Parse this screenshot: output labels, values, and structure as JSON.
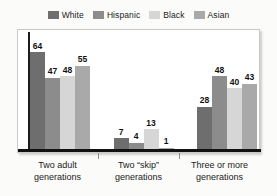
{
  "chart_data": {
    "type": "bar",
    "title": "",
    "subtitle": "",
    "xlabel": "",
    "ylabel": "",
    "ylim": [
      0,
      70
    ],
    "grid": false,
    "legend_position": "top-center",
    "categories": [
      "Two adult generations",
      "Two \"skip\" generations",
      "Three or more generations"
    ],
    "category_lines": [
      [
        "Two adult",
        "generations"
      ],
      [
        "Two “skip”",
        "generations"
      ],
      [
        "Three or more",
        "generations"
      ]
    ],
    "series": [
      {
        "name": "White",
        "color": "#6e6e6e",
        "values": [
          64,
          7,
          28
        ]
      },
      {
        "name": "Hispanic",
        "color": "#8c8c8c",
        "values": [
          47,
          4,
          48
        ]
      },
      {
        "name": "Black",
        "color": "#d6d6d6",
        "values": [
          48,
          13,
          40
        ]
      },
      {
        "name": "Asian",
        "color": "#a9a9a9",
        "values": [
          55,
          1,
          43
        ]
      }
    ]
  },
  "legend": {
    "items": [
      {
        "label": "White",
        "color": "#6e6e6e"
      },
      {
        "label": "Hispanic",
        "color": "#8c8c8c"
      },
      {
        "label": "Black",
        "color": "#d6d6d6"
      },
      {
        "label": "Asian",
        "color": "#a9a9a9"
      }
    ]
  },
  "axis": {
    "baseline_color": "#111111",
    "y_axis_color": "#1c1c1c",
    "tick_color": "#8d8d8d"
  },
  "style": {
    "page_background": "#fbfbfa",
    "plot_background": "#ffffff",
    "plot_border": "#c9c9c9",
    "label_color": "#111111"
  }
}
